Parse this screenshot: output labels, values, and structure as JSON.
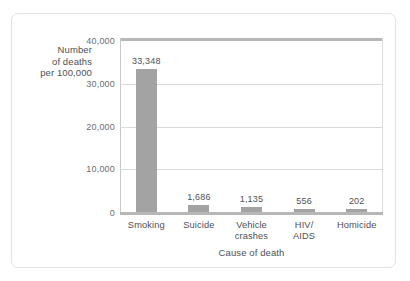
{
  "chart_data": {
    "type": "bar",
    "title": "",
    "categories": [
      "Smoking",
      "Suicide",
      "Vehicle crashes",
      "HIV/ AIDS",
      "Homicide"
    ],
    "values": [
      33348,
      1686,
      1135,
      556,
      202
    ],
    "value_labels": [
      "33,348",
      "1,686",
      "1,135",
      "556",
      "202"
    ],
    "xlabel": "Cause of death",
    "ylabel": "Number of deaths per 100,000",
    "ylabel_lines": [
      "Number",
      "of deaths",
      "per 100,000"
    ],
    "ylim": [
      0,
      40000
    ],
    "yticks": [
      0,
      10000,
      20000,
      30000,
      40000
    ],
    "ytick_labels": [
      "0",
      "10,000",
      "20,000",
      "30,000",
      "40,000"
    ],
    "grid": true,
    "legend": "none",
    "bar_color": "#a3a3a3",
    "axis_color": "#b7b7b7",
    "grid_color": "#d9d9d9"
  },
  "category_lines": [
    [
      "Smoking"
    ],
    [
      "Suicide"
    ],
    [
      "Vehicle",
      "crashes"
    ],
    [
      "HIV/",
      "AIDS"
    ],
    [
      "Homicide"
    ]
  ]
}
